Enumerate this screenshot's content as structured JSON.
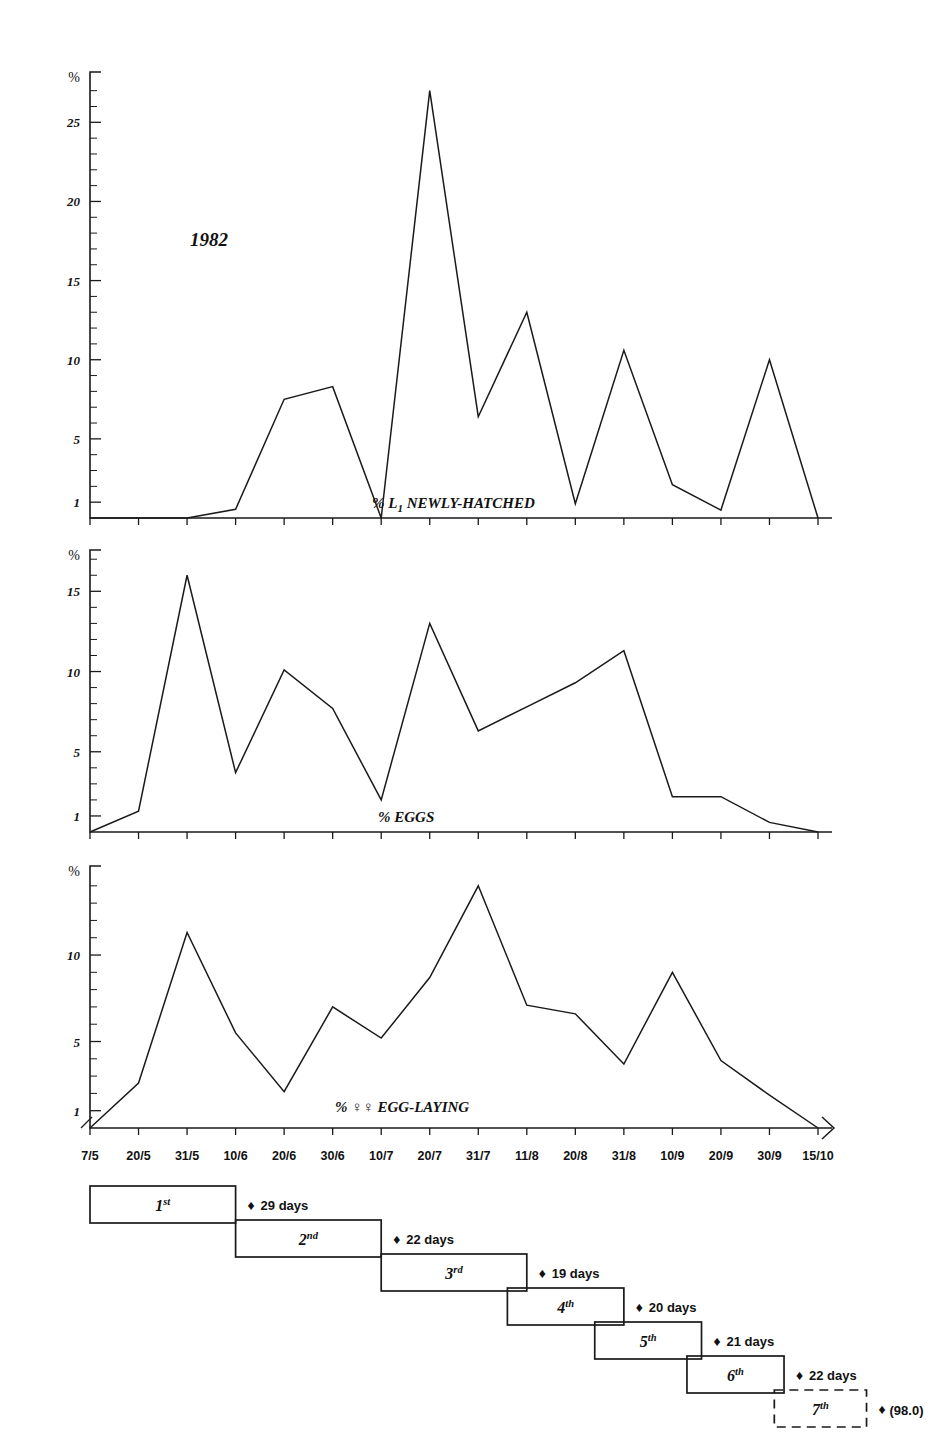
{
  "figure": {
    "year_annotation": "1982",
    "x_axis": {
      "tick_labels": [
        "7/5",
        "20/5",
        "31/5",
        "10/6",
        "20/6",
        "30/6",
        "10/7",
        "20/7",
        "31/7",
        "11/8",
        "20/8",
        "31/8",
        "10/9",
        "20/9",
        "30/9",
        "15/10"
      ]
    }
  },
  "chart_data": [
    {
      "type": "line",
      "title": "% L₁ NEWLY-HATCHED",
      "caption_parts": {
        "pct": "%",
        "main": "L",
        "sub": "1",
        "rest": " NEWLY-HATCHED"
      },
      "xlabel": "",
      "ylabel": "%",
      "x": [
        "7/5",
        "20/5",
        "31/5",
        "10/6",
        "20/6",
        "30/6",
        "10/7",
        "20/7",
        "31/7",
        "11/8",
        "20/8",
        "31/8",
        "10/9",
        "20/9",
        "30/9",
        "15/10"
      ],
      "values": [
        0,
        0,
        0,
        0.55,
        7.5,
        8.3,
        0,
        27.0,
        6.4,
        13.0,
        0.9,
        10.6,
        2.1,
        0.5,
        10.0,
        0
      ],
      "ytick_labels": [
        "1",
        "5",
        "10",
        "15",
        "20",
        "25"
      ],
      "ytick_values": [
        1,
        5,
        10,
        15,
        20,
        25
      ],
      "ylim": [
        0,
        27.8
      ],
      "grid": false,
      "legend": "none"
    },
    {
      "type": "line",
      "title": "% EGGS",
      "caption_parts": {
        "pct": "%",
        "main": "EGGS",
        "sub": "",
        "rest": ""
      },
      "xlabel": "",
      "ylabel": "%",
      "x": [
        "7/5",
        "20/5",
        "31/5",
        "10/6",
        "20/6",
        "30/6",
        "10/7",
        "20/7",
        "31/7",
        "11/8",
        "20/8",
        "31/8",
        "10/9",
        "20/9",
        "30/9",
        "15/10"
      ],
      "values": [
        0,
        1.3,
        16.0,
        3.7,
        10.1,
        7.7,
        2.0,
        13.0,
        6.3,
        7.8,
        9.3,
        11.3,
        2.2,
        2.2,
        0.6,
        0
      ],
      "ytick_labels": [
        "1",
        "5",
        "10",
        "15"
      ],
      "ytick_values": [
        1,
        5,
        10,
        15
      ],
      "ylim": [
        0,
        17.2
      ],
      "grid": false,
      "legend": "none"
    },
    {
      "type": "line",
      "title": "% ♀♀ EGG-LAYING",
      "caption_parts": {
        "pct": "%",
        "main": "♀♀",
        "sub": "",
        "rest": " EGG-LAYING"
      },
      "xlabel": "",
      "ylabel": "%",
      "x": [
        "7/5",
        "20/5",
        "31/5",
        "10/6",
        "20/6",
        "30/6",
        "10/7",
        "20/7",
        "31/7",
        "11/8",
        "20/8",
        "31/8",
        "10/9",
        "20/9",
        "30/9",
        "15/10"
      ],
      "values": [
        0,
        2.6,
        11.3,
        5.5,
        2.1,
        7.0,
        5.2,
        8.7,
        14.0,
        7.1,
        6.6,
        3.7,
        9.0,
        3.9,
        1.9,
        0
      ],
      "ytick_labels": [
        "1",
        "5",
        "10"
      ],
      "ytick_values": [
        1,
        5,
        10
      ],
      "ylim": [
        0,
        14.8
      ],
      "grid": false,
      "legend": "none"
    }
  ],
  "generations": [
    {
      "ordinal": "1",
      "suffix": "st",
      "start_index": 0,
      "end_index": 3,
      "duration": "29 days",
      "dashed": false,
      "note": ""
    },
    {
      "ordinal": "2",
      "suffix": "nd",
      "start_index": 3,
      "end_index": 6,
      "duration": "22 days",
      "dashed": false,
      "note": ""
    },
    {
      "ordinal": "3",
      "suffix": "rd",
      "start_index": 6,
      "end_index": 9,
      "duration": "19 days",
      "dashed": false,
      "note": ""
    },
    {
      "ordinal": "4",
      "suffix": "th",
      "start_index": 8.6,
      "end_index": 11,
      "duration": "20 days",
      "dashed": false,
      "note": ""
    },
    {
      "ordinal": "5",
      "suffix": "th",
      "start_index": 10.4,
      "end_index": 12.6,
      "duration": "21 days",
      "dashed": false,
      "note": ""
    },
    {
      "ordinal": "6",
      "suffix": "th",
      "start_index": 12.3,
      "end_index": 14.3,
      "duration": "22 days",
      "dashed": false,
      "note": ""
    },
    {
      "ordinal": "7",
      "suffix": "th",
      "start_index": 14.1,
      "end_index": 16.0,
      "duration": "",
      "dashed": true,
      "note": "(98.0)"
    }
  ]
}
